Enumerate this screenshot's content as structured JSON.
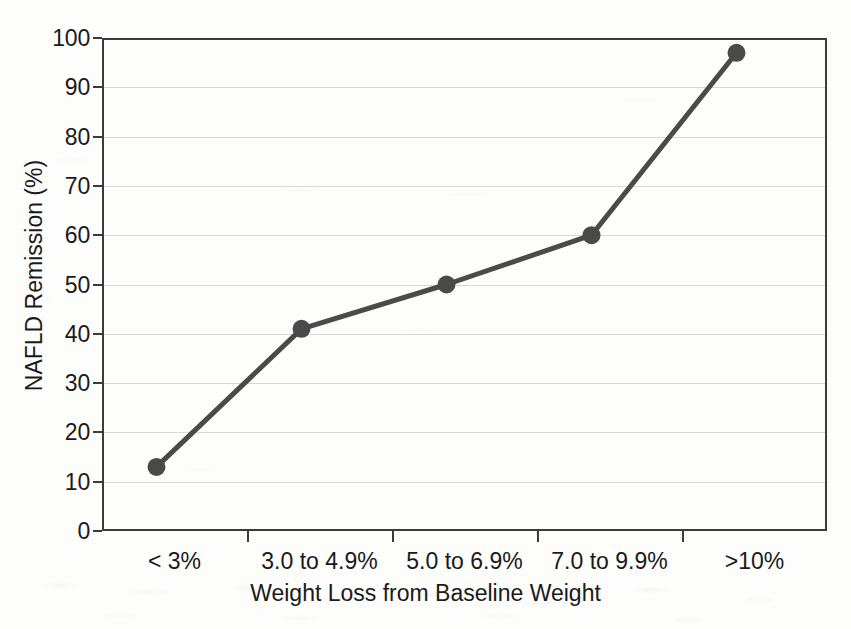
{
  "chart_data": {
    "type": "line",
    "title": "",
    "xlabel": "Weight Loss from Baseline Weight",
    "ylabel": "NAFLD Remission (%)",
    "categories": [
      "< 3%",
      "3.0 to 4.9%",
      "5.0 to 6.9%",
      "7.0 to 9.9%",
      ">10%"
    ],
    "values": [
      13,
      41,
      50,
      60,
      97
    ],
    "series": [
      {
        "name": "NAFLD Remission",
        "values": [
          13,
          41,
          50,
          60,
          97
        ]
      }
    ],
    "ylim": [
      0,
      100
    ],
    "ytick_labels": [
      "0",
      "10",
      "20",
      "30",
      "40",
      "50",
      "60",
      "70",
      "80",
      "90",
      "100"
    ],
    "ytick_values": [
      0,
      10,
      20,
      30,
      40,
      50,
      60,
      70,
      80,
      90,
      100
    ],
    "grid": true,
    "legend": false,
    "legend_position": "none",
    "marker": "circle",
    "line_color": "#4a4a4a",
    "marker_color": "#4a4a4a",
    "grid_color": "#d9d9d9",
    "axis_color": "#3b3b3b",
    "text_color": "#1a1a1a",
    "background_color": "#fdfdfc"
  }
}
